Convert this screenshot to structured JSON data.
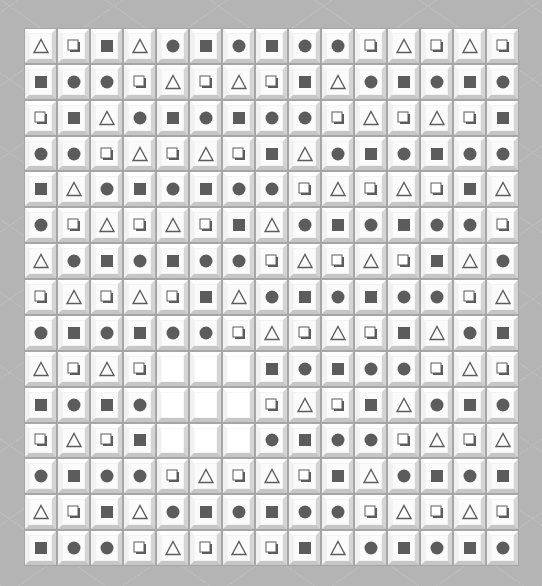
{
  "game": {
    "type": "tile-matching board",
    "columns": 15,
    "rows": 15,
    "legend": {
      "T": "triangle-outline",
      "O": "hollow-square",
      "S": "filled-square",
      "C": "filled-circle",
      "_": "empty"
    },
    "colors": {
      "background": "#b4b4b4",
      "tile": "#fbfbfb",
      "icon": "#5c5c5c"
    },
    "grid": [
      [
        "T",
        "O",
        "S",
        "T",
        "C",
        "S",
        "C",
        "S",
        "C",
        "C",
        "O",
        "T",
        "O",
        "T",
        "O"
      ],
      [
        "S",
        "C",
        "C",
        "O",
        "T",
        "O",
        "T",
        "O",
        "S",
        "T",
        "C",
        "S",
        "C",
        "S",
        "C"
      ],
      [
        "O",
        "S",
        "T",
        "C",
        "S",
        "C",
        "S",
        "C",
        "C",
        "O",
        "T",
        "O",
        "T",
        "O",
        "S"
      ],
      [
        "C",
        "C",
        "O",
        "T",
        "O",
        "T",
        "O",
        "S",
        "T",
        "C",
        "S",
        "C",
        "S",
        "C",
        "C"
      ],
      [
        "S",
        "T",
        "C",
        "S",
        "C",
        "S",
        "C",
        "C",
        "O",
        "T",
        "O",
        "T",
        "O",
        "S",
        "T"
      ],
      [
        "C",
        "O",
        "T",
        "O",
        "T",
        "O",
        "S",
        "T",
        "C",
        "S",
        "C",
        "S",
        "C",
        "C",
        "O"
      ],
      [
        "T",
        "C",
        "S",
        "C",
        "S",
        "C",
        "C",
        "O",
        "T",
        "O",
        "T",
        "O",
        "S",
        "T",
        "C"
      ],
      [
        "O",
        "T",
        "O",
        "T",
        "O",
        "S",
        "T",
        "C",
        "S",
        "C",
        "S",
        "C",
        "C",
        "O",
        "T"
      ],
      [
        "C",
        "S",
        "C",
        "S",
        "C",
        "C",
        "O",
        "T",
        "O",
        "T",
        "O",
        "S",
        "T",
        "C",
        "S"
      ],
      [
        "T",
        "O",
        "T",
        "O",
        "_",
        "_",
        "_",
        "S",
        "C",
        "S",
        "C",
        "C",
        "O",
        "T",
        "O"
      ],
      [
        "S",
        "C",
        "S",
        "C",
        "_",
        "_",
        "_",
        "O",
        "T",
        "O",
        "S",
        "T",
        "C",
        "S",
        "C"
      ],
      [
        "O",
        "T",
        "O",
        "S",
        "_",
        "_",
        "_",
        "C",
        "S",
        "C",
        "C",
        "O",
        "T",
        "O",
        "T"
      ],
      [
        "C",
        "S",
        "C",
        "C",
        "O",
        "T",
        "O",
        "T",
        "O",
        "S",
        "T",
        "C",
        "S",
        "C",
        "S"
      ],
      [
        "T",
        "O",
        "S",
        "T",
        "C",
        "S",
        "C",
        "S",
        "C",
        "C",
        "O",
        "T",
        "O",
        "T",
        "O"
      ],
      [
        "S",
        "C",
        "C",
        "O",
        "T",
        "O",
        "T",
        "O",
        "S",
        "T",
        "C",
        "S",
        "C",
        "S",
        "C"
      ]
    ]
  }
}
